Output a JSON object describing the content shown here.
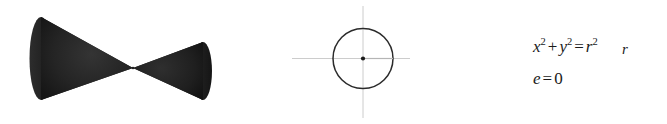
{
  "figure": {
    "background_color": "#ffffff",
    "panels": [
      {
        "name": "double-cone",
        "caption": "",
        "shape": "double cone (two nappes meeting at apex)",
        "fill_color": "#1f1f1f"
      },
      {
        "name": "circle-with-radius",
        "caption": "",
        "shape": "circle centered on axes with radius segment",
        "stroke_color": "#2b2b2b",
        "axis_color": "#cccccc",
        "radius_label": "r",
        "center_dot_color": "#1a1a1a"
      },
      {
        "name": "conic-equations",
        "caption": ""
      }
    ]
  },
  "equations": {
    "conic": {
      "full_text": "x² + y² = r²",
      "terms": {
        "x": "x",
        "x_exp": "2",
        "plus": "+",
        "y": "y",
        "y_exp": "2",
        "equals": "=",
        "r": "r",
        "r_exp": "2"
      }
    },
    "eccentricity": {
      "full_text": "e = 0",
      "terms": {
        "e": "e",
        "equals": "=",
        "value": "0"
      }
    }
  },
  "labels": {
    "radius": "r"
  },
  "colors": {
    "cone_fill": "#1f1f1f",
    "circle_stroke": "#2b2b2b",
    "axis": "#cccccc",
    "text": "#1a1a1a",
    "background": "#ffffff"
  }
}
